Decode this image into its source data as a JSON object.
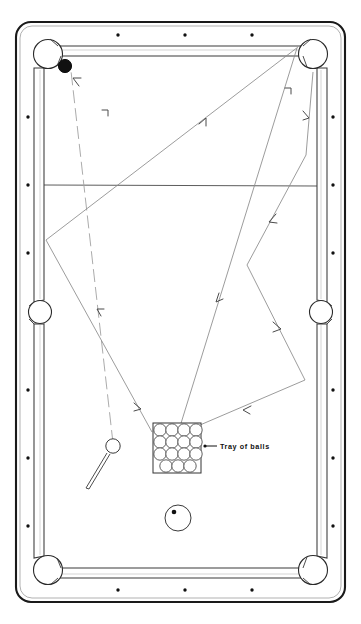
{
  "figure": {
    "background_color": "#ffffff",
    "line_color": "#555555",
    "rail_color": "#1a1a1a",
    "cloth_color": "#ffffff",
    "width": 361,
    "height": 624
  },
  "annotations": {
    "tray_of_balls_label": "Tray  of  balls"
  },
  "table": {
    "outer_frame": {
      "x": 16,
      "y": 22,
      "width": 329,
      "height": 580,
      "corner_radius": 14
    },
    "cushion_frame": {
      "x": 34,
      "y": 40,
      "width": 293,
      "height": 544
    },
    "pockets": [
      {
        "name": "top-left-corner-pocket",
        "cx": 48,
        "cy": 54,
        "r": 14
      },
      {
        "name": "top-right-corner-pocket",
        "cx": 313,
        "cy": 54,
        "r": 14
      },
      {
        "name": "left-side-pocket",
        "cx": 40,
        "cy": 312,
        "r": 11
      },
      {
        "name": "right-side-pocket",
        "cx": 321,
        "cy": 312,
        "r": 11
      },
      {
        "name": "bottom-left-corner-pocket",
        "cx": 48,
        "cy": 570,
        "r": 14
      },
      {
        "name": "bottom-right-corner-pocket",
        "cx": 313,
        "cy": 570,
        "r": 14
      }
    ],
    "rail_spots_top": [
      118,
      185,
      252
    ],
    "rail_spots_bottom": [
      118,
      185,
      252
    ],
    "rail_spots_left": [
      117,
      185,
      253,
      390,
      458,
      526
    ],
    "rail_spots_right": [
      117,
      185,
      253,
      390,
      458,
      526
    ],
    "head_string_y": 185
  },
  "balls": [
    {
      "name": "object-ball-black",
      "cx": 65,
      "cy": 66,
      "r": 6.5,
      "fill": "#111111"
    },
    {
      "name": "cue-ball",
      "cx": 113,
      "cy": 446,
      "r": 7.0,
      "fill": "#ffffff"
    },
    {
      "name": "spotted-ball",
      "cx": 178,
      "cy": 518,
      "r": 13.0,
      "fill": "#ffffff",
      "spot": {
        "dx": -4,
        "dy": -5,
        "r": 2.2
      }
    }
  ],
  "cue_stick": {
    "name": "cue-stick",
    "x1": 87,
    "y1": 487,
    "x2": 110,
    "y2": 452
  },
  "tray": {
    "name": "tray-of-balls",
    "x": 153,
    "y": 423,
    "width": 48,
    "height": 50,
    "rows": 4,
    "cols": 4,
    "ball_count": 15,
    "leader_line": {
      "x1": 203,
      "y1": 446,
      "x2": 216,
      "y2": 446
    },
    "label_x": 219,
    "label_y": 449
  },
  "shot_paths": [
    {
      "name": "path-cueball-to-topleft",
      "points": [
        [
          113,
          446
        ],
        [
          71,
          71
        ]
      ],
      "dashed": true,
      "arrows": [
        {
          "x": 98,
          "y": 312,
          "angle": -96
        }
      ]
    },
    {
      "name": "path-long-diagonal-right",
      "points": [
        [
          46,
          240
        ],
        [
          296,
          47
        ]
      ],
      "dashed": false,
      "arrows": [
        {
          "x": 203,
          "y": 119,
          "angle": -37
        }
      ]
    },
    {
      "name": "path-v-left-lower",
      "points": [
        [
          46,
          240
        ],
        [
          150,
          430
        ]
      ],
      "dashed": false,
      "arrows": [
        {
          "x": 137,
          "y": 407,
          "angle": 61
        }
      ]
    },
    {
      "name": "path-topright-down-to-tray",
      "points": [
        [
          296,
          47
        ],
        [
          178,
          433
        ]
      ],
      "dashed": false,
      "arrows": [
        {
          "x": 218,
          "y": 299,
          "angle": 107
        }
      ]
    },
    {
      "name": "path-right-rail-bounce",
      "points": [
        [
          313,
          72
        ],
        [
          305,
          157
        ],
        [
          247,
          265
        ],
        [
          304,
          380
        ],
        [
          178,
          433
        ]
      ],
      "dashed": false,
      "arrows": [
        {
          "x": 309,
          "y": 118,
          "angle": 95
        },
        {
          "x": 271,
          "y": 222,
          "angle": 118
        },
        {
          "x": 279,
          "y": 330,
          "angle": 63
        },
        {
          "x": 245,
          "y": 410,
          "angle": 157
        }
      ]
    }
  ],
  "tick_marks": [
    {
      "name": "tick-upper-left",
      "x": 105,
      "y": 113
    },
    {
      "name": "tick-upper-right",
      "x": 288,
      "y": 91
    }
  ]
}
